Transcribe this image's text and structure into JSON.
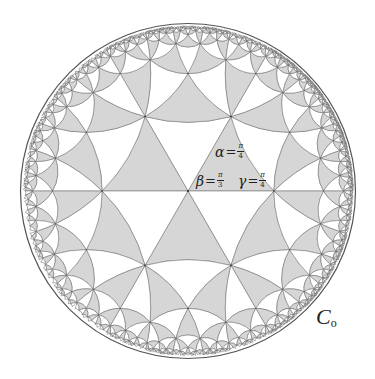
{
  "figure": {
    "type": "hyperbolic-triangle-tiling-poincare-disk",
    "disk": {
      "center_x": 188,
      "center_y": 191,
      "radius": 166
    },
    "triangle_angles": {
      "alpha": "π/4",
      "beta": "π/3",
      "gamma": "π/4"
    },
    "colors": {
      "shaded": "#d6d6d6",
      "unshaded": "#ffffff",
      "edge": "#6a6a6a",
      "boundary": "#555555",
      "vertex": "#333333"
    },
    "max_depth": 11
  },
  "labels": {
    "alpha": {
      "symbol": "α",
      "eq": "=",
      "num": "π",
      "den": "4"
    },
    "beta": {
      "symbol": "β",
      "eq": "=",
      "num": "π",
      "den": "3"
    },
    "gamma": {
      "symbol": "γ",
      "eq": "=",
      "num": "π",
      "den": "4"
    },
    "circle": {
      "symbol": "C",
      "sub": "o"
    }
  }
}
